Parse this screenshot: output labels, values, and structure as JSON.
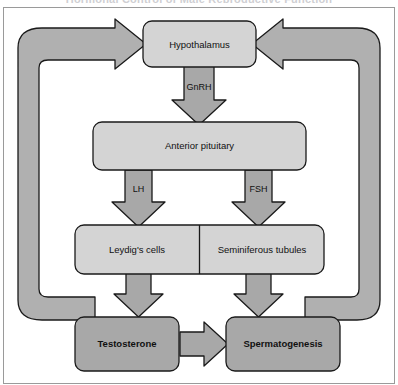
{
  "figure": {
    "title": "Hormonal Control of Male Reproductive Function",
    "frame_border_color": "#9a9a9a",
    "background": "#ffffff"
  },
  "colors": {
    "node_light_fill": "#d4d4d4",
    "node_dark_fill": "#a8a8a8",
    "arrow_fill": "#a8a8a8",
    "loop_fill": "#b0b0b0",
    "stroke": "#1a1a1a",
    "text": "#111111"
  },
  "nodes": [
    {
      "id": "hypothalamus",
      "label": "Hypothalamus",
      "style": "light",
      "bold": false
    },
    {
      "id": "anterior-pituitary",
      "label": "Anterior pituitary",
      "style": "light",
      "bold": false
    },
    {
      "id": "leydigs-cells",
      "label": "Leydig's cells",
      "style": "light",
      "bold": false
    },
    {
      "id": "seminiferous-tubules",
      "label": "Seminiferous tubules",
      "style": "light",
      "bold": false
    },
    {
      "id": "testosterone",
      "label": "Testosterone",
      "style": "dark",
      "bold": true
    },
    {
      "id": "spermatogenesis",
      "label": "Spermatogenesis",
      "style": "dark",
      "bold": true
    }
  ],
  "arrow_labels": [
    {
      "id": "gnrh",
      "label": "GnRH",
      "from": "hypothalamus",
      "to": "anterior-pituitary",
      "direction": "down"
    },
    {
      "id": "lh",
      "label": "LH",
      "from": "anterior-pituitary",
      "to": "leydigs-cells",
      "direction": "down"
    },
    {
      "id": "fsh",
      "label": "FSH",
      "from": "anterior-pituitary",
      "to": "seminiferous-tubules",
      "direction": "down"
    }
  ],
  "unlabeled_arrows": [
    {
      "id": "leydig-to-testosterone",
      "from": "leydigs-cells",
      "to": "testosterone",
      "direction": "down"
    },
    {
      "id": "seminiferous-to-spermato",
      "from": "seminiferous-tubules",
      "to": "spermatogenesis",
      "direction": "down"
    },
    {
      "id": "testosterone-to-spermato",
      "from": "testosterone",
      "to": "spermatogenesis",
      "direction": "right"
    }
  ],
  "feedback_loops": [
    {
      "id": "left-feedback-loop",
      "from": "testosterone",
      "to": "hypothalamus",
      "side": "left",
      "direction": "right"
    },
    {
      "id": "right-feedback-loop",
      "from": "spermatogenesis",
      "to": "hypothalamus",
      "side": "right",
      "direction": "left"
    }
  ]
}
